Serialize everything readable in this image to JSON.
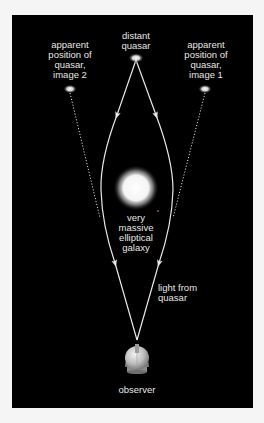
{
  "diagram": {
    "colors": {
      "page_background": "#f5f5f5",
      "panel_background": "#000000",
      "line": "#e8e8e8",
      "text": "#e6e6e6",
      "galaxy": "#ffffff",
      "observer": "#bdbdbd"
    },
    "labels": {
      "distant_quasar": "distant\nquasar",
      "image2": "apparent\nposition of\nquasar,\nimage 2",
      "image1": "apparent\nposition of\nquasar,\nimage 1",
      "galaxy": "very\nmassive\nelliptical\ngalaxy",
      "light": "light from\nquasar",
      "observer": "observer"
    },
    "nodes": {
      "quasar": {
        "x": 136,
        "y": 58
      },
      "image2": {
        "x": 70,
        "y": 89
      },
      "image1": {
        "x": 205,
        "y": 89
      },
      "galaxy": {
        "x": 136,
        "y": 188,
        "r": 17
      },
      "observer": {
        "x": 137,
        "y": 358
      }
    },
    "paths": {
      "light_left": "M136,60 L117,115 Q100,160 101,190 Q102,225 115,263 L137,340",
      "light_right": "M136,60 L156,115 Q173,160 173,190 Q172,225 159,263 L137,340",
      "dotted_left": "M70,93 L100,218",
      "dotted_right": "M205,93 L173,218"
    },
    "arrows": [
      {
        "x": 117,
        "y": 115,
        "angle": 200
      },
      {
        "x": 156,
        "y": 115,
        "angle": 160
      },
      {
        "x": 115,
        "y": 263,
        "angle": 164
      },
      {
        "x": 159,
        "y": 263,
        "angle": 196
      }
    ]
  }
}
